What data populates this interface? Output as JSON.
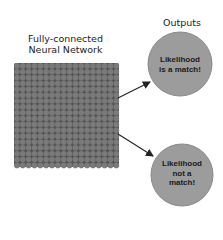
{
  "network": {
    "title_line1": "Fully-connected",
    "title_line2": "Neural Network",
    "grid": {
      "rows": 18,
      "cols": 18,
      "x": 14,
      "y": 63,
      "pitch": 5.85,
      "node_radius": 2.8,
      "node_color": "#7a7a7a",
      "background_color": "#555555"
    }
  },
  "outputs": {
    "title": "Outputs",
    "nodes": [
      {
        "label_line1": "Likelihood",
        "label_line2": "is a match!",
        "label_line3": ""
      },
      {
        "label_line1": "Likelihood",
        "label_line2": "not a",
        "label_line3": "match!"
      }
    ],
    "node_fill": "#9c9c9c",
    "node_stroke": "#8a8a8a"
  },
  "arrows": [
    {
      "from": "network",
      "to": "output-1"
    },
    {
      "from": "network",
      "to": "output-2"
    }
  ]
}
